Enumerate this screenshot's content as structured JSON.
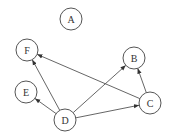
{
  "graph": {
    "nodes": [
      {
        "id": "A",
        "label": "A",
        "x": 71,
        "y": 19
      },
      {
        "id": "B",
        "label": "B",
        "x": 134,
        "y": 58
      },
      {
        "id": "C",
        "label": "C",
        "x": 150,
        "y": 103
      },
      {
        "id": "D",
        "label": "D",
        "x": 65,
        "y": 120
      },
      {
        "id": "E",
        "label": "E",
        "x": 26,
        "y": 92
      },
      {
        "id": "F",
        "label": "F",
        "x": 27,
        "y": 50
      }
    ],
    "edges": [
      {
        "from": "D",
        "to": "F"
      },
      {
        "from": "D",
        "to": "E"
      },
      {
        "from": "D",
        "to": "B"
      },
      {
        "from": "D",
        "to": "C"
      },
      {
        "from": "C",
        "to": "F"
      },
      {
        "from": "C",
        "to": "B"
      }
    ],
    "node_radius": 11,
    "colors": {
      "stroke": "#555555",
      "text": "#333333",
      "background": "#ffffff"
    }
  }
}
